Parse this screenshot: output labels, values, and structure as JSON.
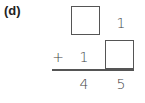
{
  "problem": {
    "label": "(d)",
    "row1": {
      "tens": "",
      "ones": "1"
    },
    "row2": {
      "operator": "+",
      "tens": "1",
      "ones": ""
    },
    "result": {
      "tens": "4",
      "ones": "5"
    }
  }
}
